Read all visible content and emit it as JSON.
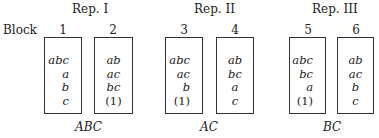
{
  "row_label": "Block",
  "replicates": [
    {
      "label": "Rep. I",
      "confounded": "ABC"
    },
    {
      "label": "Rep. II",
      "confounded": "AC"
    },
    {
      "label": "Rep. III",
      "confounded": "BC"
    }
  ],
  "blocks": [
    {
      "number": "1",
      "treatments": [
        "abc",
        "a",
        "b",
        "c"
      ]
    },
    {
      "number": "2",
      "treatments": [
        "ab",
        "ac",
        "bc",
        "(1)"
      ]
    },
    {
      "number": "3",
      "treatments": [
        "abc",
        "ac",
        "b",
        "(1)"
      ]
    },
    {
      "number": "4",
      "treatments": [
        "ab",
        "bc",
        "a",
        "c"
      ]
    },
    {
      "number": "5",
      "treatments": [
        "abc",
        "bc",
        "a",
        "(1)"
      ]
    },
    {
      "number": "6",
      "treatments": [
        "ab",
        "ac",
        "b",
        "c"
      ]
    }
  ]
}
